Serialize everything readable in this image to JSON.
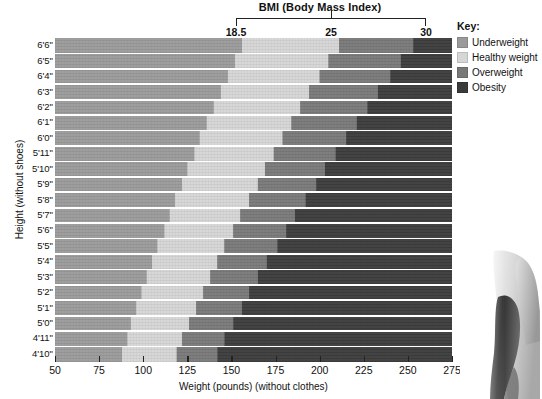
{
  "chart_data": {
    "type": "heatmap",
    "title": "BMI (Body Mass Index)",
    "xlabel": "Weight (pounds) (without clothes)",
    "ylabel": "Height (without shoes)",
    "xlim": [
      50,
      275
    ],
    "x_ticks": [
      50,
      75,
      100,
      125,
      150,
      175,
      200,
      225,
      250,
      275
    ],
    "x_tick_labels": [
      "50",
      "75",
      "100",
      "125",
      "150",
      "175",
      "200",
      "225",
      "250",
      "275"
    ],
    "y_tick_labels": [
      "6'6\"",
      "6'5\"",
      "6'4\"",
      "6'3\"",
      "6'2\"",
      "6'1\"",
      "6'0\"",
      "5'11\"",
      "5'10\"",
      "5'9\"",
      "5'8\"",
      "5'7\"",
      "5'6\"",
      "5'5\"",
      "5'4\"",
      "5'3\"",
      "5'2\"",
      "5'1\"",
      "5'0\"",
      "4'11\"",
      "4'10\""
    ],
    "bmi_axis": {
      "label": "BMI (Body Mass Index)",
      "ticks": [
        "18.5",
        "25",
        "30"
      ],
      "tick_values": [
        18.5,
        25,
        30
      ]
    },
    "categories": [
      "Underweight",
      "Healthy weight",
      "Overweight",
      "Obesity"
    ],
    "bmi_thresholds": [
      18.5,
      25,
      30
    ],
    "grid": true,
    "legend_position": "right",
    "boundaries_weight_by_height": [
      {
        "height": "6'6\"",
        "bmi_18_5": 156,
        "bmi_25": 211,
        "bmi_30": 253
      },
      {
        "height": "6'5\"",
        "bmi_18_5": 152,
        "bmi_25": 205,
        "bmi_30": 246
      },
      {
        "height": "6'4\"",
        "bmi_18_5": 148,
        "bmi_25": 200,
        "bmi_30": 240
      },
      {
        "height": "6'3\"",
        "bmi_18_5": 144,
        "bmi_25": 194,
        "bmi_30": 233
      },
      {
        "height": "6'2\"",
        "bmi_18_5": 140,
        "bmi_25": 189,
        "bmi_30": 227
      },
      {
        "height": "6'1\"",
        "bmi_18_5": 136,
        "bmi_25": 184,
        "bmi_30": 221
      },
      {
        "height": "6'0\"",
        "bmi_18_5": 132,
        "bmi_25": 179,
        "bmi_30": 215
      },
      {
        "height": "5'11\"",
        "bmi_18_5": 129,
        "bmi_25": 174,
        "bmi_30": 209
      },
      {
        "height": "5'10\"",
        "bmi_18_5": 125,
        "bmi_25": 169,
        "bmi_30": 203
      },
      {
        "height": "5'9\"",
        "bmi_18_5": 122,
        "bmi_25": 165,
        "bmi_30": 198
      },
      {
        "height": "5'8\"",
        "bmi_18_5": 118,
        "bmi_25": 160,
        "bmi_30": 192
      },
      {
        "height": "5'7\"",
        "bmi_18_5": 115,
        "bmi_25": 155,
        "bmi_30": 186
      },
      {
        "height": "5'6\"",
        "bmi_18_5": 112,
        "bmi_25": 151,
        "bmi_30": 181
      },
      {
        "height": "5'5\"",
        "bmi_18_5": 108,
        "bmi_25": 146,
        "bmi_30": 176
      },
      {
        "height": "5'4\"",
        "bmi_18_5": 105,
        "bmi_25": 142,
        "bmi_30": 170
      },
      {
        "height": "5'3\"",
        "bmi_18_5": 102,
        "bmi_25": 138,
        "bmi_30": 165
      },
      {
        "height": "5'2\"",
        "bmi_18_5": 99,
        "bmi_25": 134,
        "bmi_30": 160
      },
      {
        "height": "5'1\"",
        "bmi_18_5": 96,
        "bmi_25": 130,
        "bmi_30": 156
      },
      {
        "height": "5'0\"",
        "bmi_18_5": 93,
        "bmi_25": 126,
        "bmi_30": 151
      },
      {
        "height": "4'11\"",
        "bmi_18_5": 91,
        "bmi_25": 122,
        "bmi_30": 146
      },
      {
        "height": "4'10\"",
        "bmi_18_5": 88,
        "bmi_25": 119,
        "bmi_30": 142
      }
    ]
  },
  "legend": {
    "title": "Key:",
    "items": [
      {
        "label": "Underweight",
        "color": "#9a9a9a"
      },
      {
        "label": "Healthy weight",
        "color": "#d6d6d6"
      },
      {
        "label": "Overweight",
        "color": "#787878"
      },
      {
        "label": "Obesity",
        "color": "#3a3a3a"
      }
    ]
  },
  "colors": {
    "underweight": "#9a9a9a",
    "healthy": "#d6d6d6",
    "overweight": "#787878",
    "obesity": "#3a3a3a",
    "gridline": "#ffffff",
    "axis": "#222222",
    "text": "#111111",
    "background": "#ffffff"
  }
}
